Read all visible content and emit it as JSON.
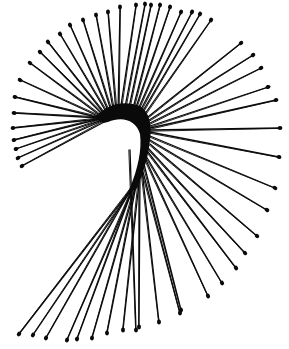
{
  "image": {
    "subject": "bobby pins arranged in a spiral fan",
    "width": 289,
    "height": 349,
    "background": "#ffffff",
    "ink": "#0a0a0a"
  },
  "pins": [
    {
      "x1": 120,
      "y1": 112,
      "x2": 136,
      "y2": 5
    },
    {
      "x1": 124,
      "y1": 112,
      "x2": 145,
      "y2": 4
    },
    {
      "x1": 118,
      "y1": 113,
      "x2": 120,
      "y2": 7
    },
    {
      "x1": 116,
      "y1": 113,
      "x2": 108,
      "y2": 12
    },
    {
      "x1": 114,
      "y1": 114,
      "x2": 96,
      "y2": 15
    },
    {
      "x1": 112,
      "y1": 114,
      "x2": 83,
      "y2": 20
    },
    {
      "x1": 110,
      "y1": 115,
      "x2": 70,
      "y2": 25
    },
    {
      "x1": 108,
      "y1": 115,
      "x2": 60,
      "y2": 34
    },
    {
      "x1": 106,
      "y1": 116,
      "x2": 48,
      "y2": 42
    },
    {
      "x1": 104,
      "y1": 116,
      "x2": 40,
      "y2": 52
    },
    {
      "x1": 102,
      "y1": 117,
      "x2": 30,
      "y2": 63
    },
    {
      "x1": 100,
      "y1": 117,
      "x2": 20,
      "y2": 80
    },
    {
      "x1": 100,
      "y1": 118,
      "x2": 15,
      "y2": 97
    },
    {
      "x1": 100,
      "y1": 118,
      "x2": 14,
      "y2": 113
    },
    {
      "x1": 100,
      "y1": 119,
      "x2": 13,
      "y2": 128
    },
    {
      "x1": 100,
      "y1": 119,
      "x2": 14,
      "y2": 140
    },
    {
      "x1": 102,
      "y1": 120,
      "x2": 16,
      "y2": 149
    },
    {
      "x1": 104,
      "y1": 120,
      "x2": 18,
      "y2": 158
    },
    {
      "x1": 106,
      "y1": 121,
      "x2": 22,
      "y2": 166
    },
    {
      "x1": 128,
      "y1": 112,
      "x2": 151,
      "y2": 5
    },
    {
      "x1": 132,
      "y1": 112,
      "x2": 160,
      "y2": 5
    },
    {
      "x1": 134,
      "y1": 113,
      "x2": 170,
      "y2": 7
    },
    {
      "x1": 136,
      "y1": 114,
      "x2": 181,
      "y2": 12
    },
    {
      "x1": 138,
      "y1": 115,
      "x2": 192,
      "y2": 12
    },
    {
      "x1": 140,
      "y1": 116,
      "x2": 200,
      "y2": 14
    },
    {
      "x1": 142,
      "y1": 118,
      "x2": 211,
      "y2": 20
    },
    {
      "x1": 144,
      "y1": 120,
      "x2": 241,
      "y2": 43
    },
    {
      "x1": 146,
      "y1": 122,
      "x2": 253,
      "y2": 55
    },
    {
      "x1": 148,
      "y1": 124,
      "x2": 261,
      "y2": 68
    },
    {
      "x1": 150,
      "y1": 126,
      "x2": 268,
      "y2": 87
    },
    {
      "x1": 150,
      "y1": 128,
      "x2": 276,
      "y2": 100
    },
    {
      "x1": 150,
      "y1": 130,
      "x2": 280,
      "y2": 128
    },
    {
      "x1": 150,
      "y1": 132,
      "x2": 279,
      "y2": 157
    },
    {
      "x1": 150,
      "y1": 136,
      "x2": 275,
      "y2": 188
    },
    {
      "x1": 150,
      "y1": 140,
      "x2": 267,
      "y2": 210
    },
    {
      "x1": 150,
      "y1": 144,
      "x2": 257,
      "y2": 236
    },
    {
      "x1": 148,
      "y1": 148,
      "x2": 245,
      "y2": 253
    },
    {
      "x1": 148,
      "y1": 152,
      "x2": 236,
      "y2": 268
    },
    {
      "x1": 146,
      "y1": 156,
      "x2": 222,
      "y2": 283
    },
    {
      "x1": 146,
      "y1": 160,
      "x2": 208,
      "y2": 296
    },
    {
      "x1": 144,
      "y1": 164,
      "x2": 181,
      "y2": 310
    },
    {
      "x1": 142,
      "y1": 168,
      "x2": 180,
      "y2": 313
    },
    {
      "x1": 142,
      "y1": 170,
      "x2": 159,
      "y2": 322
    },
    {
      "x1": 140,
      "y1": 172,
      "x2": 139,
      "y2": 327
    },
    {
      "x1": 140,
      "y1": 174,
      "x2": 123,
      "y2": 330
    },
    {
      "x1": 138,
      "y1": 176,
      "x2": 107,
      "y2": 333
    },
    {
      "x1": 138,
      "y1": 178,
      "x2": 92,
      "y2": 338
    },
    {
      "x1": 136,
      "y1": 180,
      "x2": 77,
      "y2": 339
    },
    {
      "x1": 136,
      "y1": 182,
      "x2": 67,
      "y2": 340
    },
    {
      "x1": 134,
      "y1": 184,
      "x2": 46,
      "y2": 338
    },
    {
      "x1": 134,
      "y1": 186,
      "x2": 33,
      "y2": 335
    },
    {
      "x1": 132,
      "y1": 188,
      "x2": 19,
      "y2": 334
    },
    {
      "x1": 130,
      "y1": 150,
      "x2": 136,
      "y2": 330
    }
  ],
  "hub": {
    "path": "M96 116 C 108 104, 124 100, 140 106 C 150 112, 152 126, 150 140 C 148 160, 142 176, 136 190 L 130 188 C 138 168, 142 150, 140 134 C 136 120, 122 116, 108 122 C 102 124, 98 122, 96 116 Z"
  }
}
